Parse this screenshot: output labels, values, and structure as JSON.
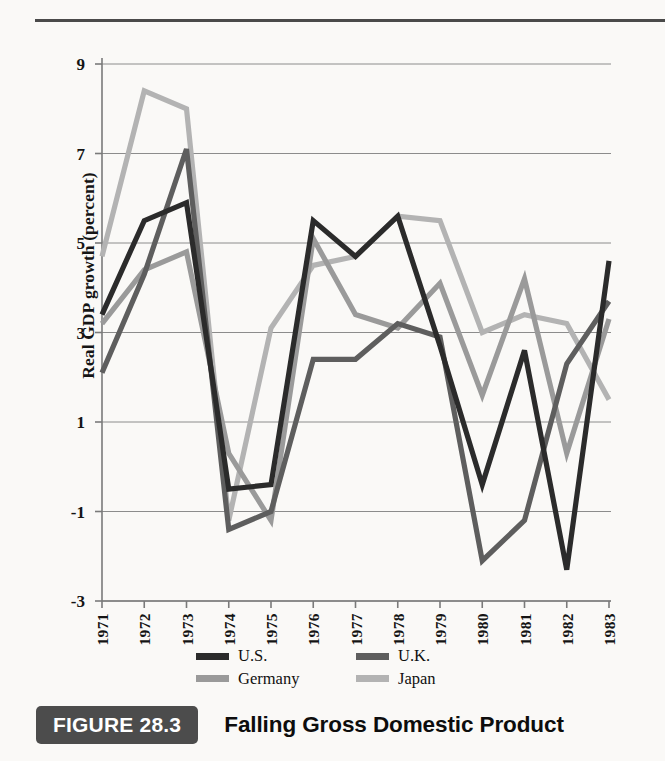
{
  "figure": {
    "badge": "FIGURE 28.3",
    "title": "Falling Gross Domestic Product"
  },
  "colors": {
    "us": "#2b2b2b",
    "uk": "#5e5e5e",
    "germany": "#9a9a9a",
    "japan": "#b3b3b3",
    "grid": "#8c8c8c",
    "axis": "#7a7a7a",
    "rule": "#4a4a4a",
    "badge_bg": "#4c4c4c",
    "text": "#141414"
  },
  "axes": {
    "ylabel": "Real GDP growth (percent)",
    "yticks": [
      "9",
      "7",
      "5",
      "3",
      "1",
      "-1",
      "-3"
    ],
    "ylim": [
      -3,
      9
    ],
    "xticks": [
      "1971",
      "1972",
      "1973",
      "1974",
      "1975",
      "1976",
      "1977",
      "1978",
      "1979",
      "1980",
      "1981",
      "1982",
      "1983"
    ],
    "grid": true
  },
  "legend": {
    "position": "bottom",
    "entries": [
      {
        "label": "U.S.",
        "color": "#2b2b2b",
        "key": "us"
      },
      {
        "label": "U.K.",
        "color": "#5e5e5e",
        "key": "uk"
      },
      {
        "label": "Germany",
        "color": "#9a9a9a",
        "key": "germany"
      },
      {
        "label": "Japan",
        "color": "#b3b3b3",
        "key": "japan"
      }
    ]
  },
  "chart_data": {
    "type": "line",
    "title": "Falling Gross Domestic Product",
    "xlabel": "",
    "ylabel": "Real GDP growth (percent)",
    "ylim": [
      -3,
      9
    ],
    "grid": true,
    "legend_position": "bottom",
    "x": [
      1971,
      1972,
      1973,
      1974,
      1975,
      1976,
      1977,
      1978,
      1979,
      1980,
      1981,
      1982,
      1983
    ],
    "categories": [
      "1971",
      "1972",
      "1973",
      "1974",
      "1975",
      "1976",
      "1977",
      "1978",
      "1979",
      "1980",
      "1981",
      "1982",
      "1983"
    ],
    "series": [
      {
        "name": "U.S.",
        "color": "#2b2b2b",
        "values": [
          3.4,
          5.5,
          5.9,
          -0.5,
          -0.4,
          5.5,
          4.7,
          5.6,
          2.7,
          -0.4,
          2.6,
          -2.3,
          4.6
        ]
      },
      {
        "name": "U.K.",
        "color": "#5e5e5e",
        "values": [
          2.1,
          4.3,
          7.1,
          -1.4,
          -1.0,
          2.4,
          2.4,
          3.2,
          2.9,
          -2.1,
          -1.2,
          2.3,
          3.7
        ]
      },
      {
        "name": "Germany",
        "color": "#9a9a9a",
        "values": [
          3.2,
          4.4,
          4.8,
          0.3,
          -1.2,
          5.1,
          3.4,
          3.1,
          4.1,
          1.6,
          4.2,
          0.3,
          3.3
        ]
      },
      {
        "name": "Japan",
        "color": "#b3b3b3",
        "values": [
          4.7,
          8.4,
          8.0,
          -1.2,
          3.1,
          4.5,
          4.7,
          5.6,
          5.5,
          3.0,
          3.4,
          3.2,
          1.5
        ]
      }
    ]
  }
}
